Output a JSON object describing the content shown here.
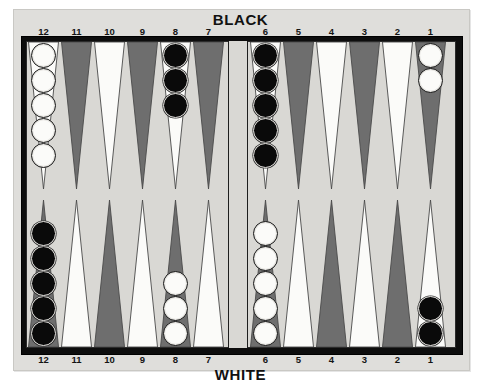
{
  "board": {
    "title_top": "BLACK",
    "title_bottom": "WHITE",
    "surface_color": "#d9d8d4",
    "frame_color": "#0d0d0d",
    "panel_color": "#dfdedb",
    "point_dark_color": "#6e6e6e",
    "point_light_color": "#fbfbf9",
    "checker_white_color": "#fbfbf9",
    "checker_black_color": "#0a0a0a"
  },
  "labels": {
    "top": [
      "12",
      "11",
      "10",
      "9",
      "8",
      "7",
      "6",
      "5",
      "4",
      "3",
      "2",
      "1"
    ],
    "bottom": [
      "12",
      "11",
      "10",
      "9",
      "8",
      "7",
      "6",
      "5",
      "4",
      "3",
      "2",
      "1"
    ]
  },
  "chart_data": {
    "type": "table",
    "xlabel": "Point number",
    "ylabel": "Checkers on point",
    "categories": [
      "top-12",
      "top-11",
      "top-10",
      "top-9",
      "top-8",
      "top-7",
      "top-6",
      "top-5",
      "top-4",
      "top-3",
      "top-2",
      "top-1",
      "bottom-12",
      "bottom-11",
      "bottom-10",
      "bottom-9",
      "bottom-8",
      "bottom-7",
      "bottom-6",
      "bottom-5",
      "bottom-4",
      "bottom-3",
      "bottom-2",
      "bottom-1"
    ],
    "values": [
      5,
      0,
      0,
      0,
      3,
      0,
      5,
      0,
      0,
      0,
      0,
      2,
      5,
      0,
      0,
      0,
      3,
      0,
      5,
      0,
      0,
      0,
      0,
      2
    ],
    "series": [
      {
        "name": "white",
        "values": [
          5,
          0,
          0,
          0,
          0,
          0,
          0,
          0,
          0,
          0,
          0,
          2,
          0,
          0,
          0,
          0,
          3,
          0,
          5,
          0,
          0,
          0,
          0,
          0
        ]
      },
      {
        "name": "black",
        "values": [
          0,
          0,
          0,
          0,
          3,
          0,
          5,
          0,
          0,
          0,
          0,
          0,
          5,
          0,
          0,
          0,
          0,
          0,
          0,
          0,
          0,
          0,
          0,
          2
        ]
      }
    ],
    "legend": [
      "white",
      "black"
    ],
    "legend_position": "none",
    "grid": false
  },
  "quadrants": {
    "top_left": {
      "name": "top-left-quadrant",
      "points": [
        {
          "label": "12",
          "triangle": "light",
          "checkers": {
            "color": "white",
            "count": 5
          }
        },
        {
          "label": "11",
          "triangle": "dark",
          "checkers": {
            "color": "none",
            "count": 0
          }
        },
        {
          "label": "10",
          "triangle": "light",
          "checkers": {
            "color": "none",
            "count": 0
          }
        },
        {
          "label": "9",
          "triangle": "dark",
          "checkers": {
            "color": "none",
            "count": 0
          }
        },
        {
          "label": "8",
          "triangle": "light",
          "checkers": {
            "color": "black",
            "count": 3
          }
        },
        {
          "label": "7",
          "triangle": "dark",
          "checkers": {
            "color": "none",
            "count": 0
          }
        }
      ]
    },
    "top_right": {
      "name": "top-right-quadrant",
      "points": [
        {
          "label": "6",
          "triangle": "light",
          "checkers": {
            "color": "black",
            "count": 5
          }
        },
        {
          "label": "5",
          "triangle": "dark",
          "checkers": {
            "color": "none",
            "count": 0
          }
        },
        {
          "label": "4",
          "triangle": "light",
          "checkers": {
            "color": "none",
            "count": 0
          }
        },
        {
          "label": "3",
          "triangle": "dark",
          "checkers": {
            "color": "none",
            "count": 0
          }
        },
        {
          "label": "2",
          "triangle": "light",
          "checkers": {
            "color": "none",
            "count": 0
          }
        },
        {
          "label": "1",
          "triangle": "dark",
          "checkers": {
            "color": "white",
            "count": 2
          }
        }
      ]
    },
    "bottom_left": {
      "name": "bottom-left-quadrant",
      "points": [
        {
          "label": "12",
          "triangle": "dark",
          "checkers": {
            "color": "black",
            "count": 5
          }
        },
        {
          "label": "11",
          "triangle": "light",
          "checkers": {
            "color": "none",
            "count": 0
          }
        },
        {
          "label": "10",
          "triangle": "dark",
          "checkers": {
            "color": "none",
            "count": 0
          }
        },
        {
          "label": "9",
          "triangle": "light",
          "checkers": {
            "color": "none",
            "count": 0
          }
        },
        {
          "label": "8",
          "triangle": "dark",
          "checkers": {
            "color": "white",
            "count": 3
          }
        },
        {
          "label": "7",
          "triangle": "light",
          "checkers": {
            "color": "none",
            "count": 0
          }
        }
      ]
    },
    "bottom_right": {
      "name": "bottom-right-quadrant",
      "points": [
        {
          "label": "6",
          "triangle": "dark",
          "checkers": {
            "color": "white",
            "count": 5
          }
        },
        {
          "label": "5",
          "triangle": "light",
          "checkers": {
            "color": "none",
            "count": 0
          }
        },
        {
          "label": "4",
          "triangle": "dark",
          "checkers": {
            "color": "none",
            "count": 0
          }
        },
        {
          "label": "3",
          "triangle": "light",
          "checkers": {
            "color": "none",
            "count": 0
          }
        },
        {
          "label": "2",
          "triangle": "dark",
          "checkers": {
            "color": "none",
            "count": 0
          }
        },
        {
          "label": "1",
          "triangle": "light",
          "checkers": {
            "color": "black",
            "count": 2
          }
        }
      ]
    }
  }
}
